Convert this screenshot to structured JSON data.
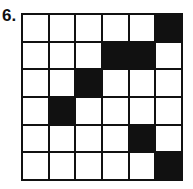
{
  "problem": {
    "label": "6.",
    "rows": 6,
    "cols": 6,
    "fill_color": "#111111",
    "empty_color": "#ffffff",
    "grid": [
      [
        0,
        0,
        0,
        0,
        0,
        1
      ],
      [
        0,
        0,
        0,
        1,
        1,
        0
      ],
      [
        0,
        0,
        1,
        0,
        0,
        0
      ],
      [
        0,
        1,
        0,
        0,
        0,
        0
      ],
      [
        0,
        0,
        0,
        0,
        1,
        0
      ],
      [
        0,
        0,
        0,
        0,
        0,
        1
      ]
    ]
  }
}
